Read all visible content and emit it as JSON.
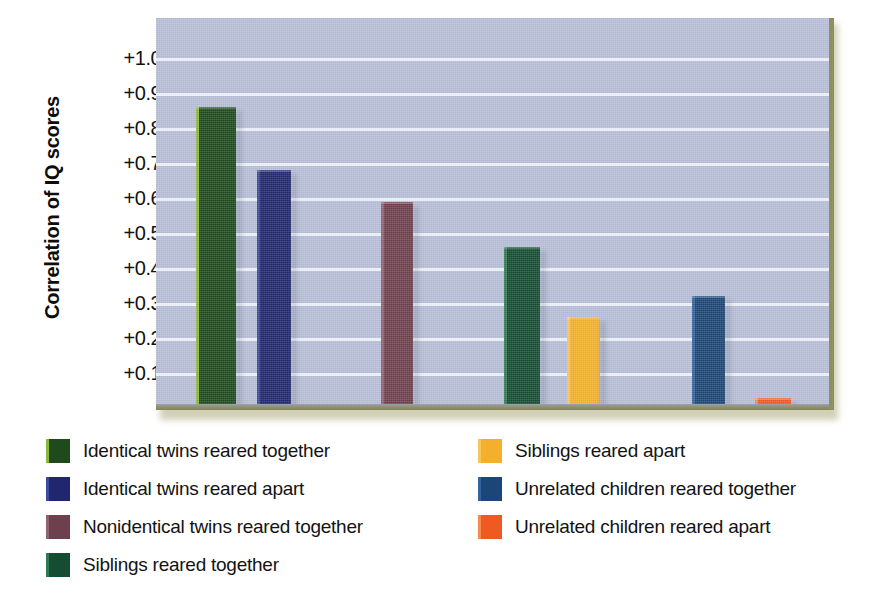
{
  "chart_data": {
    "type": "bar",
    "title": "",
    "xlabel": "",
    "ylabel": "Correlation of IQ scores",
    "ylim": [
      0,
      1.05
    ],
    "grid": true,
    "legend_position": "bottom",
    "ytick_labels": [
      "+1.00",
      "+0.90",
      "+0.80",
      "+0.70",
      "+0.60",
      "+0.50",
      "+0.40",
      "+0.30",
      "+0.20",
      "+0.10"
    ],
    "ytick_values": [
      1.0,
      0.9,
      0.8,
      0.7,
      0.6,
      0.5,
      0.4,
      0.3,
      0.2,
      0.1
    ],
    "categories": [
      "Identical twins reared together",
      "Identical twins reared apart",
      "Nonidentical twins reared together",
      "Siblings reared together",
      "Siblings reared apart",
      "Unrelated children reared together",
      "Unrelated children reared apart"
    ],
    "values": [
      0.86,
      0.68,
      0.59,
      0.46,
      0.26,
      0.32,
      0.03
    ],
    "colors": [
      "#1f4a1c",
      "#20276e",
      "#6e3f4c",
      "#154d33",
      "#f4b02c",
      "#1c4677",
      "#ef5a22"
    ],
    "edge_colors": [
      "#8cb83a",
      "#3a4a9c",
      "#8e6470",
      "#2f7a52",
      "#f6c55c",
      "#34639c",
      "#f58a4e"
    ],
    "bars": [
      {
        "label": "Identical twins reared together",
        "value": 0.86,
        "color": "#1f4a1c",
        "x": 196,
        "width": 40
      },
      {
        "label": "Identical twins reared apart",
        "value": 0.68,
        "color": "#20276e",
        "x": 257,
        "width": 34
      },
      {
        "label": "Nonidentical twins reared together",
        "value": 0.59,
        "color": "#6e3f4c",
        "x": 381,
        "width": 32
      },
      {
        "label": "Siblings reared together",
        "value": 0.46,
        "color": "#154d33",
        "x": 504,
        "width": 36
      },
      {
        "label": "Siblings reared apart",
        "value": 0.26,
        "color": "#f4b02c",
        "x": 567,
        "width": 33
      },
      {
        "label": "Unrelated children reared together",
        "value": 0.32,
        "color": "#1c4677",
        "x": 692,
        "width": 33
      },
      {
        "label": "Unrelated children reared apart",
        "value": 0.03,
        "color": "#ef5a22",
        "x": 755,
        "width": 36
      }
    ],
    "plot_background_color": "#b6bed8",
    "gridline_color": "#f2f4fb",
    "border_color": "#8e8f5e"
  },
  "legend": {
    "left_column": [
      {
        "label": "Identical twins reared together",
        "color": "#1f4a1c",
        "edge": "#8cb83a"
      },
      {
        "label": "Identical twins reared apart",
        "color": "#20276e",
        "edge": "#3a4a9c"
      },
      {
        "label": "Nonidentical twins reared together",
        "color": "#6e3f4c",
        "edge": "#8e6470"
      },
      {
        "label": "Siblings reared together",
        "color": "#154d33",
        "edge": "#2f7a52"
      }
    ],
    "right_column": [
      {
        "label": "Siblings reared apart",
        "color": "#f4b02c",
        "edge": "#f6c55c"
      },
      {
        "label": "Unrelated children reared together",
        "color": "#1c4677",
        "edge": "#34639c"
      },
      {
        "label": "Unrelated children reared apart",
        "color": "#ef5a22",
        "edge": "#f58a4e"
      }
    ]
  }
}
